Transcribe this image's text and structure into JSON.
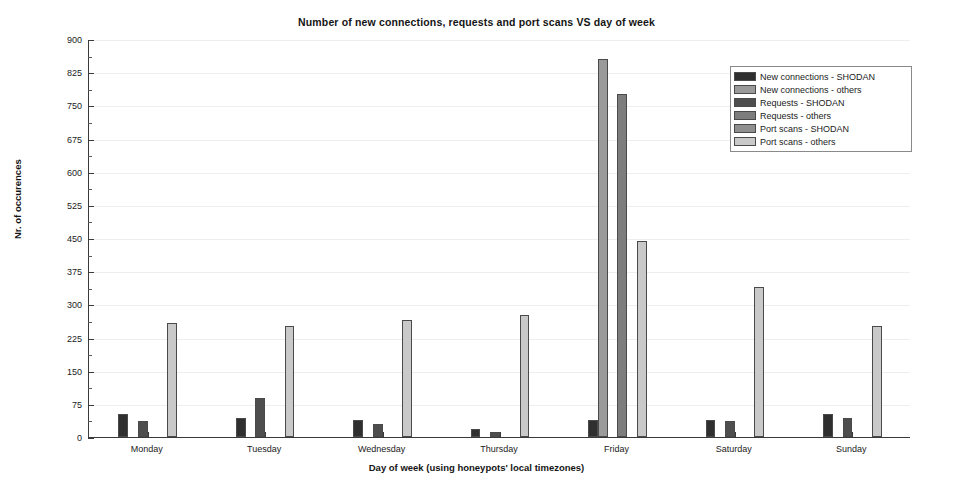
{
  "chart_data": {
    "type": "bar",
    "title": "Number of new connections, requests and port scans VS day of week",
    "xlabel": "Day of week (using honeypots' local timezones)",
    "ylabel": "Nr. of occurences",
    "categories": [
      "Monday",
      "Tuesday",
      "Wednesday",
      "Thursday",
      "Friday",
      "Saturday",
      "Sunday"
    ],
    "ylim": [
      0,
      900
    ],
    "yticks": [
      0,
      75,
      150,
      225,
      300,
      375,
      450,
      525,
      600,
      675,
      750,
      825,
      900
    ],
    "ytick_labels": [
      "0",
      "75",
      "150",
      "225",
      "300",
      "375",
      "450",
      "525",
      "600",
      "675",
      "750",
      "825",
      "900"
    ],
    "grid": true,
    "legend_position": "upper right",
    "series": [
      {
        "name": "New connections - SHODAN",
        "color": "#2f2f2f",
        "values": [
          52,
          43,
          38,
          18,
          38,
          38,
          52
        ]
      },
      {
        "name": "New connections - others",
        "color": "#9a9a9a",
        "values": [
          0,
          0,
          0,
          0,
          855,
          0,
          0
        ]
      },
      {
        "name": "Requests - SHODAN",
        "color": "#4e4e4e",
        "values": [
          37,
          88,
          30,
          12,
          0,
          36,
          43
        ]
      },
      {
        "name": "Requests - others",
        "color": "#7d7d7d",
        "values": [
          0,
          0,
          0,
          0,
          775,
          0,
          0
        ]
      },
      {
        "name": "Port scans - SHODAN",
        "color": "#8f8f8f",
        "values": [
          0,
          0,
          0,
          0,
          0,
          0,
          0
        ]
      },
      {
        "name": "Port scans - others",
        "color": "#c9c9c9",
        "values": [
          258,
          250,
          265,
          275,
          443,
          340,
          250
        ]
      }
    ]
  },
  "legend": {
    "items": [
      {
        "label": "New connections - SHODAN",
        "color": "#2f2f2f"
      },
      {
        "label": "New connections - others",
        "color": "#9a9a9a"
      },
      {
        "label": "Requests - SHODAN",
        "color": "#4e4e4e"
      },
      {
        "label": "Requests - others",
        "color": "#7d7d7d"
      },
      {
        "label": "Port scans - SHODAN",
        "color": "#8f8f8f"
      },
      {
        "label": "Port scans - others",
        "color": "#c9c9c9"
      }
    ]
  },
  "colors": {
    "axis": "#3a3a3a",
    "grid": "#eeeeee",
    "text": "#1b1b1b",
    "background": "#ffffff"
  }
}
